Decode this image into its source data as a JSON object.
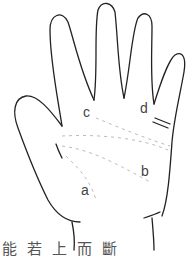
{
  "figure": {
    "labels": {
      "a": "a",
      "b": "b",
      "c": "c",
      "d": "d"
    },
    "caption": "能若上而斷"
  },
  "colors": {
    "line": "#222222",
    "dashed": "#bbbbbb",
    "text": "#444444"
  }
}
